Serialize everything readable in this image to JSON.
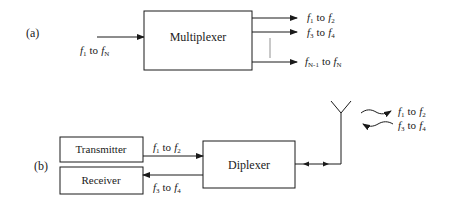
{
  "diagram_a": {
    "label": "(a)",
    "block": "Multiplexer",
    "input": {
      "f_start": "1",
      "to": "to",
      "f_end": "N"
    },
    "outputs": [
      {
        "f_start": "1",
        "to": "to",
        "f_end": "2"
      },
      {
        "f_start": "3",
        "to": "to",
        "f_end": "4"
      },
      {
        "f_start": "N-1",
        "to": "to",
        "f_end": "N"
      }
    ]
  },
  "diagram_b": {
    "label": "(b)",
    "transmitter": "Transmitter",
    "receiver": "Receiver",
    "block": "Diplexer",
    "tx_signal": {
      "f_start": "1",
      "to": "to",
      "f_end": "2"
    },
    "rx_signal": {
      "f_start": "3",
      "to": "to",
      "f_end": "4"
    },
    "antenna_out": {
      "f_start": "1",
      "to": "to",
      "f_end": "2"
    },
    "antenna_in": {
      "f_start": "3",
      "to": "to",
      "f_end": "4"
    }
  },
  "symbols": {
    "f": "f"
  }
}
